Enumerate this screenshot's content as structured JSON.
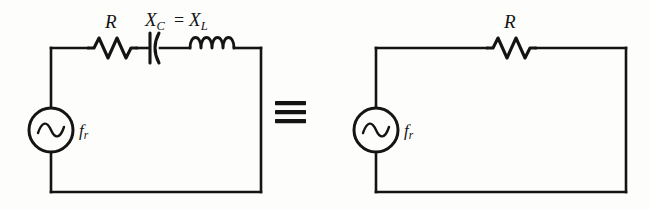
{
  "figure": {
    "equivalence_symbol": "≡",
    "ink_color": "#141414",
    "background_color": "#fdfdfc"
  },
  "left_circuit": {
    "name": "series-rlc-circuit-at-resonance",
    "source": {
      "type": "ac-voltage-source",
      "label_symbol": "f",
      "label_subscript": "r"
    },
    "resistor": {
      "label": "R"
    },
    "reactance_label": {
      "capacitor_symbol": "X",
      "capacitor_subscript": "C",
      "equals": "=",
      "inductor_symbol": "X",
      "inductor_subscript": "L"
    },
    "capacitor": {
      "name": "capacitor"
    },
    "inductor": {
      "name": "inductor"
    }
  },
  "right_circuit": {
    "name": "equivalent-resistive-circuit",
    "source": {
      "type": "ac-voltage-source",
      "label_symbol": "f",
      "label_subscript": "r"
    },
    "resistor": {
      "label": "R"
    }
  }
}
